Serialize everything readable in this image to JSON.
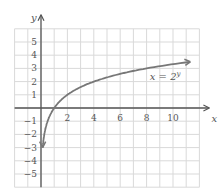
{
  "chart_data": {
    "type": "line",
    "title": "",
    "xlabel": "x",
    "ylabel": "y",
    "xlim": [
      -2,
      12
    ],
    "ylim": [
      -6,
      6
    ],
    "grid": true,
    "x_ticks": [
      2,
      4,
      6,
      8,
      10
    ],
    "x_tick_labels": [
      "2",
      "4",
      "6",
      "8",
      "10"
    ],
    "y_ticks": [
      5,
      4,
      3,
      2,
      1,
      -1,
      -2,
      -3,
      -4,
      -5
    ],
    "y_tick_labels": [
      "5",
      "4",
      "3",
      "2",
      "1",
      "−1",
      "−2",
      "−3",
      "−4",
      "−5"
    ],
    "series": [
      {
        "name": "x = 2^y",
        "label": "x = 2",
        "label_superscript": "y",
        "function": "y = log2(x)",
        "x": [
          0.125,
          0.25,
          0.5,
          1,
          2,
          4,
          8,
          11.5
        ],
        "values": [
          -3,
          -2,
          -1,
          0,
          1,
          2,
          3,
          3.52
        ],
        "color": "#777777"
      }
    ],
    "annotations": [
      {
        "text": "x = 2^y",
        "x": 9,
        "y": 2.4
      }
    ],
    "colors": {
      "grid": "#d9d9d9",
      "axis": "#555555",
      "curve": "#777777"
    }
  }
}
